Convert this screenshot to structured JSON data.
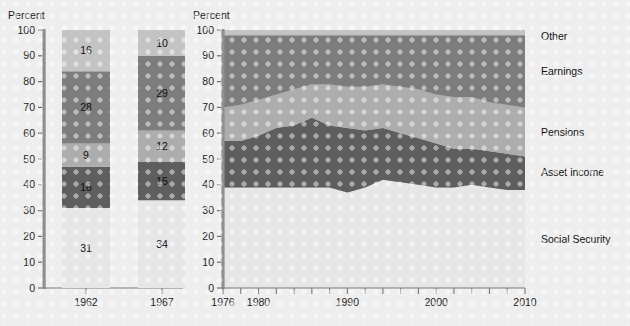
{
  "background_color": "#eeeeee",
  "series_colors": {
    "social_security": "#e6e6e6",
    "asset_income": "#5e5e5e",
    "pensions": "#adadad",
    "earnings": "#7d7d7d",
    "other": "#c3c3c3"
  },
  "bar_chart": {
    "axis_title": "Percent",
    "yticks": [
      "100",
      "90",
      "80",
      "70",
      "60",
      "50",
      "40",
      "30",
      "20",
      "10",
      "0"
    ],
    "ylim": [
      0,
      100
    ],
    "categories": [
      "1962",
      "1967"
    ],
    "stack_order": [
      "Social Security",
      "Asset income",
      "Pensions",
      "Earnings",
      "Other"
    ],
    "values": {
      "1962": [
        31,
        16,
        9,
        28,
        16
      ],
      "1967": [
        34,
        15,
        12,
        29,
        10
      ]
    },
    "labels": {
      "1962": [
        "31",
        "16",
        "9",
        "28",
        "16"
      ],
      "1967": [
        "34",
        "15",
        "12",
        "29",
        "10"
      ]
    }
  },
  "chart_data": {
    "type": "area",
    "title": "",
    "xlabel": "",
    "ylabel": "Percent",
    "ylim": [
      0,
      100
    ],
    "xlim": [
      1976,
      2010
    ],
    "grid": false,
    "legend_position": "right",
    "stacked": true,
    "percent_stacked": true,
    "x": [
      1976,
      1978,
      1980,
      1982,
      1984,
      1986,
      1988,
      1990,
      1992,
      1994,
      1996,
      1998,
      2000,
      2002,
      2004,
      2006,
      2008,
      2010
    ],
    "series": [
      {
        "name": "Social Security",
        "color": "#e6e6e6",
        "values": [
          39,
          39,
          39,
          39,
          39,
          39,
          39,
          37,
          39,
          42,
          41,
          40,
          39,
          39,
          40,
          39,
          38,
          38
        ]
      },
      {
        "name": "Asset income",
        "color": "#5e5e5e",
        "values": [
          18,
          18,
          20,
          23,
          24,
          27,
          24,
          25,
          22,
          20,
          19,
          18,
          17,
          15,
          14,
          14,
          14,
          13
        ]
      },
      {
        "name": "Pensions",
        "color": "#adadad",
        "values": [
          13,
          14,
          14,
          13,
          14,
          13,
          16,
          16,
          17,
          17,
          18,
          19,
          19,
          20,
          20,
          19,
          19,
          19
        ]
      },
      {
        "name": "Earnings",
        "color": "#7d7d7d",
        "values": [
          28,
          27,
          25,
          23,
          21,
          19,
          19,
          20,
          20,
          19,
          20,
          21,
          23,
          24,
          24,
          26,
          27,
          28
        ]
      },
      {
        "name": "Other",
        "color": "#c3c3c3",
        "values": [
          2,
          2,
          2,
          2,
          2,
          2,
          2,
          2,
          2,
          2,
          2,
          2,
          2,
          2,
          2,
          2,
          2,
          2
        ]
      }
    ],
    "xticks": [
      1976,
      1978,
      1980,
      1982,
      1984,
      1986,
      1988,
      1990,
      1992,
      1994,
      1996,
      1998,
      2000,
      2002,
      2004,
      2006,
      2008,
      2010
    ],
    "xticklabels_shown": [
      "1976",
      "1980",
      "1990",
      "2000",
      "2010"
    ],
    "yticks": [
      "100",
      "90",
      "80",
      "70",
      "60",
      "50",
      "40",
      "30",
      "20",
      "10",
      "0"
    ],
    "legend_entries": [
      "Other",
      "Earnings",
      "Pensions",
      "Asset income",
      "Social Security"
    ]
  }
}
